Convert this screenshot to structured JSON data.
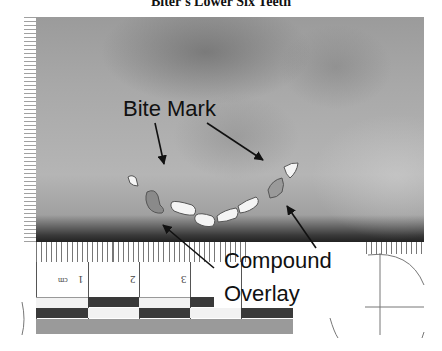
{
  "figure": {
    "title": "Biter's Lower Six Teeth",
    "labels": {
      "bite_mark": "Bite Mark",
      "compound": "Compound",
      "overlay": "Overlay"
    },
    "ruler": {
      "unit": "cm",
      "numbers": [
        "1",
        "2",
        "3"
      ]
    },
    "colors": {
      "photo_gray": "#a8a8a8",
      "dark": "#222222",
      "tooth_fill": "#f4f4f4",
      "ruler_dark": "#3a3a3a",
      "ruler_gray": "#9a9a9a"
    }
  }
}
